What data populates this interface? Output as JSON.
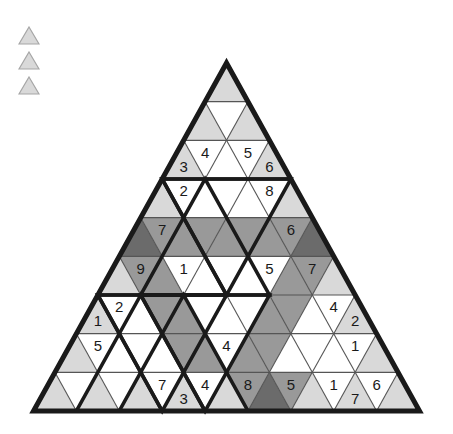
{
  "puzzle": {
    "title": "Triangular Sudoku Grid",
    "rows": 9,
    "cell_count": 81,
    "colors": {
      "white": "#ffffff",
      "light": "#d9d9d9",
      "medium": "#999999",
      "dark": "#6b6b6b",
      "line_thin": "#555555",
      "line_bold": "#1a1a1a",
      "text": "#1a1a1a",
      "background": "#ffffff"
    },
    "geometry": {
      "apex_x": 226.5,
      "apex_y": 63,
      "base_y": 411,
      "half_base": 193,
      "row_height": 38.7
    },
    "legend": {
      "name": "legend-triangles",
      "count": 3,
      "fill": "#d9d9d9",
      "stroke": "#a6a6a6",
      "size": 20
    },
    "cells": [
      [
        {
          "d": "up",
          "fill": "light",
          "v": ""
        }
      ],
      [
        {
          "d": "up",
          "fill": "light",
          "v": ""
        },
        {
          "d": "down",
          "fill": "white",
          "v": ""
        },
        {
          "d": "up",
          "fill": "light",
          "v": ""
        }
      ],
      [
        {
          "d": "up",
          "fill": "light",
          "v": "3"
        },
        {
          "d": "down",
          "fill": "white",
          "v": "4"
        },
        {
          "d": "up",
          "fill": "white",
          "v": ""
        },
        {
          "d": "down",
          "fill": "white",
          "v": "5"
        },
        {
          "d": "up",
          "fill": "light",
          "v": "6"
        }
      ],
      [
        {
          "d": "up",
          "fill": "light",
          "v": ""
        },
        {
          "d": "down",
          "fill": "white",
          "v": "2"
        },
        {
          "d": "up",
          "fill": "white",
          "v": ""
        },
        {
          "d": "down",
          "fill": "white",
          "v": ""
        },
        {
          "d": "up",
          "fill": "white",
          "v": ""
        },
        {
          "d": "down",
          "fill": "white",
          "v": "8"
        },
        {
          "d": "up",
          "fill": "light",
          "v": ""
        }
      ],
      [
        {
          "d": "up",
          "fill": "dark",
          "v": ""
        },
        {
          "d": "down",
          "fill": "medium",
          "v": "7"
        },
        {
          "d": "up",
          "fill": "medium",
          "v": ""
        },
        {
          "d": "down",
          "fill": "medium",
          "v": ""
        },
        {
          "d": "up",
          "fill": "medium",
          "v": ""
        },
        {
          "d": "down",
          "fill": "medium",
          "v": ""
        },
        {
          "d": "up",
          "fill": "medium",
          "v": ""
        },
        {
          "d": "down",
          "fill": "medium",
          "v": "6"
        },
        {
          "d": "up",
          "fill": "dark",
          "v": ""
        }
      ],
      [
        {
          "d": "up",
          "fill": "light",
          "v": ""
        },
        {
          "d": "down",
          "fill": "medium",
          "v": "9"
        },
        {
          "d": "up",
          "fill": "medium",
          "v": ""
        },
        {
          "d": "down",
          "fill": "white",
          "v": "1"
        },
        {
          "d": "up",
          "fill": "white",
          "v": ""
        },
        {
          "d": "down",
          "fill": "white",
          "v": ""
        },
        {
          "d": "up",
          "fill": "white",
          "v": ""
        },
        {
          "d": "down",
          "fill": "white",
          "v": "5"
        },
        {
          "d": "up",
          "fill": "medium",
          "v": ""
        },
        {
          "d": "down",
          "fill": "medium",
          "v": "7"
        },
        {
          "d": "up",
          "fill": "light",
          "v": ""
        }
      ],
      [
        {
          "d": "up",
          "fill": "light",
          "v": "1"
        },
        {
          "d": "down",
          "fill": "white",
          "v": "2"
        },
        {
          "d": "up",
          "fill": "white",
          "v": ""
        },
        {
          "d": "down",
          "fill": "medium",
          "v": ""
        },
        {
          "d": "up",
          "fill": "medium",
          "v": ""
        },
        {
          "d": "down",
          "fill": "white",
          "v": ""
        },
        {
          "d": "up",
          "fill": "white",
          "v": ""
        },
        {
          "d": "down",
          "fill": "white",
          "v": ""
        },
        {
          "d": "up",
          "fill": "medium",
          "v": ""
        },
        {
          "d": "down",
          "fill": "medium",
          "v": ""
        },
        {
          "d": "up",
          "fill": "white",
          "v": ""
        },
        {
          "d": "down",
          "fill": "white",
          "v": "4"
        },
        {
          "d": "up",
          "fill": "light",
          "v": "2"
        }
      ],
      [
        {
          "d": "up",
          "fill": "light",
          "v": ""
        },
        {
          "d": "down",
          "fill": "white",
          "v": "5"
        },
        {
          "d": "up",
          "fill": "white",
          "v": ""
        },
        {
          "d": "down",
          "fill": "white",
          "v": ""
        },
        {
          "d": "up",
          "fill": "white",
          "v": ""
        },
        {
          "d": "down",
          "fill": "medium",
          "v": ""
        },
        {
          "d": "up",
          "fill": "medium",
          "v": ""
        },
        {
          "d": "down",
          "fill": "white",
          "v": "4"
        },
        {
          "d": "up",
          "fill": "medium",
          "v": ""
        },
        {
          "d": "down",
          "fill": "medium",
          "v": ""
        },
        {
          "d": "up",
          "fill": "white",
          "v": ""
        },
        {
          "d": "down",
          "fill": "white",
          "v": ""
        },
        {
          "d": "up",
          "fill": "white",
          "v": ""
        },
        {
          "d": "down",
          "fill": "white",
          "v": "1"
        },
        {
          "d": "up",
          "fill": "light",
          "v": ""
        }
      ],
      [
        {
          "d": "up",
          "fill": "light",
          "v": ""
        },
        {
          "d": "down",
          "fill": "white",
          "v": ""
        },
        {
          "d": "up",
          "fill": "light",
          "v": ""
        },
        {
          "d": "down",
          "fill": "white",
          "v": ""
        },
        {
          "d": "up",
          "fill": "light",
          "v": ""
        },
        {
          "d": "down",
          "fill": "white",
          "v": "7"
        },
        {
          "d": "up",
          "fill": "light",
          "v": "3"
        },
        {
          "d": "down",
          "fill": "white",
          "v": "4"
        },
        {
          "d": "up",
          "fill": "light",
          "v": ""
        },
        {
          "d": "down",
          "fill": "medium",
          "v": "8"
        },
        {
          "d": "up",
          "fill": "dark",
          "v": ""
        },
        {
          "d": "down",
          "fill": "medium",
          "v": "5"
        },
        {
          "d": "up",
          "fill": "light",
          "v": ""
        },
        {
          "d": "down",
          "fill": "white",
          "v": "1"
        },
        {
          "d": "up",
          "fill": "light",
          "v": "7"
        },
        {
          "d": "down",
          "fill": "white",
          "v": "6"
        },
        {
          "d": "up",
          "fill": "light",
          "v": ""
        }
      ]
    ],
    "given_numbers": [
      "3",
      "4",
      "5",
      "6",
      "2",
      "8",
      "7",
      "6",
      "9",
      "1",
      "5",
      "7",
      "1",
      "2",
      "4",
      "2",
      "5",
      "4",
      "1",
      "7",
      "3",
      "4",
      "8",
      "5",
      "1",
      "7",
      "6"
    ]
  }
}
